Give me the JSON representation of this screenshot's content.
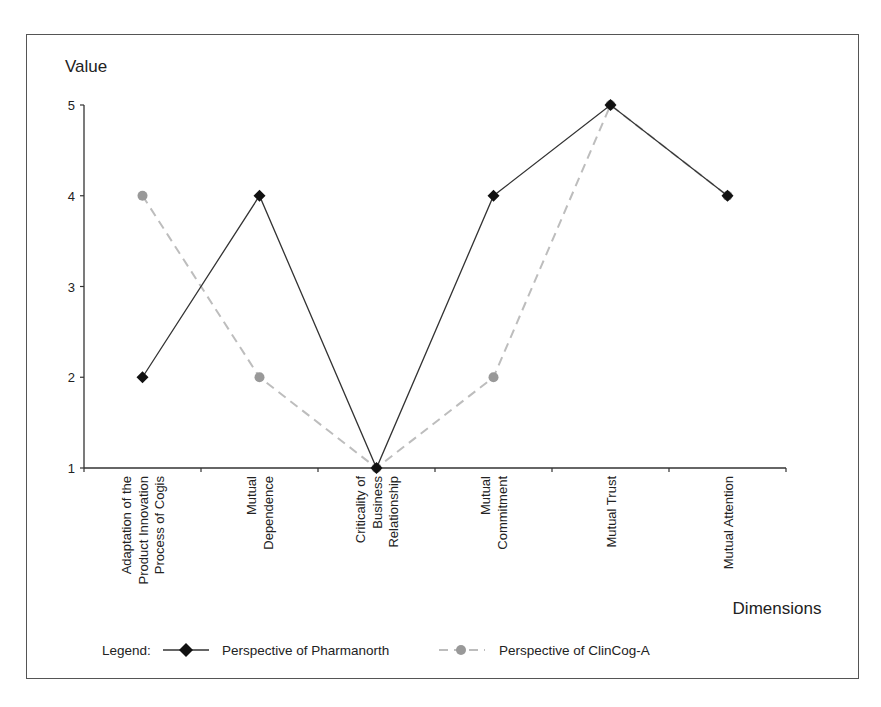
{
  "chart_data": {
    "type": "line",
    "title": "",
    "ylabel": "Value",
    "xlabel": "Dimensions",
    "ylim": [
      1,
      5
    ],
    "yticks": [
      1,
      2,
      3,
      4,
      5
    ],
    "grid": false,
    "legend_position": "bottom",
    "categories": [
      "Adaptation of the Product Innovation Process of Cogis",
      "Mutual Dependence",
      "Criticality of Business Relationship",
      "Mutual Commitment",
      "Mutual Trust",
      "Mutual Attention"
    ],
    "category_lines": [
      [
        "Adaptation of the",
        "Product Innovation",
        "Process of Cogis"
      ],
      [
        "Mutual",
        "Dependence"
      ],
      [
        "Criticality of",
        "Business",
        "Relationship"
      ],
      [
        "Mutual",
        "Commitment"
      ],
      [
        "Mutual Trust"
      ],
      [
        "Mutual Attention"
      ]
    ],
    "series": [
      {
        "name": "Perspective of Pharmanorth",
        "values": [
          2,
          4,
          1,
          4,
          5,
          4
        ],
        "color": "#333333",
        "marker": "diamond",
        "line": "solid"
      },
      {
        "name": "Perspective of ClinCog-A",
        "values": [
          4,
          2,
          1,
          2,
          5,
          4
        ],
        "color": "#bdbdbd",
        "marker_color": "#999999",
        "marker": "circle",
        "line": "dashed"
      }
    ]
  },
  "legend": {
    "label": "Legend:"
  },
  "caption": {
    "text": ""
  }
}
